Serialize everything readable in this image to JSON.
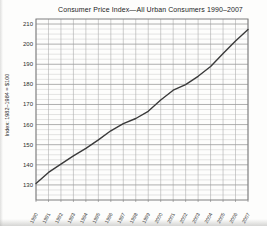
{
  "page": {
    "title": "Consumer Price Index—All Urban Consumers 1990–2007",
    "y_axis_label": "Index: 1982–1984 = $100"
  },
  "chart_data": {
    "type": "line",
    "title": "Consumer Price Index—All Urban Consumers 1990–2007",
    "xlabel": "",
    "ylabel": "Index: 1982–1984 = $100",
    "x": [
      1990,
      1991,
      1992,
      1993,
      1994,
      1995,
      1996,
      1997,
      1998,
      1999,
      2000,
      2001,
      2002,
      2003,
      2004,
      2005,
      2006,
      2007
    ],
    "values": [
      130.7,
      136.2,
      140.3,
      144.5,
      148.2,
      152.4,
      156.9,
      160.5,
      163.0,
      166.6,
      172.2,
      177.1,
      179.9,
      184.0,
      188.9,
      195.3,
      201.6,
      207.3
    ],
    "ylim": [
      122.5,
      212.5
    ],
    "yticks": [
      130,
      140,
      150,
      160,
      170,
      180,
      190,
      200,
      210
    ],
    "y_minor_step": 2.5,
    "grid": true,
    "legend": "none",
    "colors": {
      "line": "#3a3a3a",
      "grid_minor": "#c9c9c9",
      "grid_major": "#9b9b9b",
      "grid_vertical": "#adadad",
      "border": "#7e7e7e",
      "tick_text": "#2e2e2e",
      "title_text": "#1c1c1c"
    }
  }
}
